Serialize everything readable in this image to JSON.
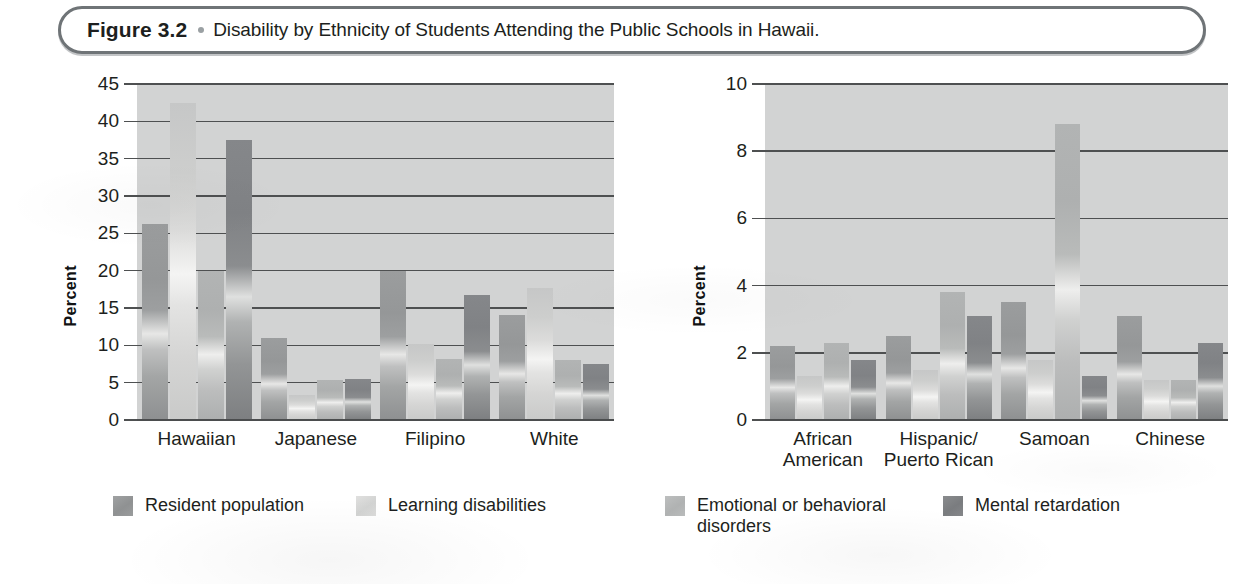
{
  "figure": {
    "number": "Figure 3.2",
    "bullet": "dot-separator",
    "caption": "Disability by Ethnicity of Students Attending the Public Schools in Hawaii."
  },
  "legend": {
    "items": [
      {
        "label": "Resident population",
        "color": "#959798"
      },
      {
        "label": "Learning disabilities",
        "color": "#d8d8d7"
      },
      {
        "label": "Emotional or behavioral\ndisorders",
        "color": "#b6b8b8"
      },
      {
        "label": "Mental retardation",
        "color": "#808285"
      }
    ]
  },
  "chart_data": [
    {
      "id": "left-panel",
      "type": "bar",
      "title": "",
      "xlabel": "",
      "ylabel": "Percent",
      "ylim": [
        0,
        45
      ],
      "yticks": [
        0,
        5,
        10,
        15,
        20,
        25,
        30,
        35,
        40,
        45
      ],
      "ytick_labels": [
        "0",
        "5",
        "10",
        "15",
        "20",
        "25",
        "30",
        "35",
        "40",
        "45"
      ],
      "grid": true,
      "legend_position": "bottom",
      "categories": [
        "Hawaiian",
        "Japanese",
        "Filipino",
        "White"
      ],
      "series": [
        {
          "name": "Resident population",
          "values": [
            26.2,
            11.0,
            20.0,
            14.0
          ]
        },
        {
          "name": "Learning disabilities",
          "values": [
            42.5,
            3.4,
            10.2,
            17.7
          ]
        },
        {
          "name": "Emotional or behavioral disorders",
          "values": [
            20.0,
            5.3,
            8.2,
            8.0
          ]
        },
        {
          "name": "Mental retardation",
          "values": [
            37.5,
            5.5,
            16.8,
            7.5
          ]
        }
      ]
    },
    {
      "id": "right-panel",
      "type": "bar",
      "title": "",
      "xlabel": "",
      "ylabel": "Percent",
      "ylim": [
        0,
        10
      ],
      "yticks": [
        0,
        2,
        4,
        6,
        8,
        10
      ],
      "ytick_labels": [
        "0",
        "2",
        "4",
        "6",
        "8",
        "10"
      ],
      "grid": true,
      "legend_position": "bottom",
      "categories": [
        "African\nAmerican",
        "Hispanic/\nPuerto Rican",
        "Samoan",
        "Chinese"
      ],
      "series": [
        {
          "name": "Resident population",
          "values": [
            2.2,
            2.5,
            3.5,
            3.1
          ]
        },
        {
          "name": "Learning disabilities",
          "values": [
            1.3,
            1.5,
            1.8,
            1.2
          ]
        },
        {
          "name": "Emotional or behavioral disorders",
          "values": [
            2.3,
            3.8,
            8.8,
            1.2
          ]
        },
        {
          "name": "Mental retardation",
          "values": [
            1.8,
            3.1,
            1.3,
            2.3
          ]
        }
      ]
    }
  ]
}
